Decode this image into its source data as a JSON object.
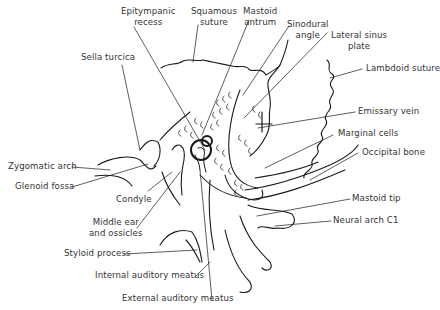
{
  "diagram": {
    "type": "anatomical line drawing",
    "line_color": "#1a1a1a",
    "text_color": "#333333"
  },
  "labels": {
    "epitympanic_recess": [
      "Epitympanic",
      "recess"
    ],
    "squamous_suture": [
      "Squamous",
      "suture"
    ],
    "mastoid_antrum": [
      "Mastoid",
      "antrum"
    ],
    "sinodural_angle": [
      "Sinodural",
      "angle"
    ],
    "lateral_sinus_plate": [
      "Lateral sinus",
      "plate"
    ],
    "sella_turcica": "Sella turcica",
    "lambdoid_suture": "Lambdoid suture",
    "emissary_vein": "Emissary vein",
    "marginal_cells": "Marginal cells",
    "occipital_bone": "Occipital bone",
    "zygomatic_arch": "Zygomatic arch",
    "glenoid_fossa": "Glenoid fossa",
    "condyle": "Condyle",
    "middle_ear": [
      "Middle ear",
      "and ossicles"
    ],
    "mastoid_tip": "Mastoid tip",
    "neural_arch": "Neural arch C1",
    "styloid_process": "Styloid process",
    "internal_auditory_meatus": "Internal auditory meatus",
    "external_auditory_meatus": "External auditory meatus"
  }
}
